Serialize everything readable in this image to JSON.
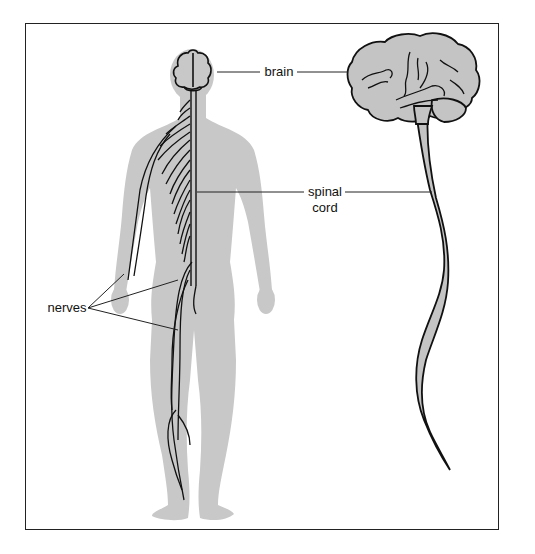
{
  "diagram": {
    "title": "",
    "labels": {
      "brain": "brain",
      "spinal_cord_line1": "spinal",
      "spinal_cord_line2": "cord",
      "nerves": "nerves"
    },
    "colors": {
      "body_fill": "#c8c8c8",
      "organ_fill": "#c4c4c4",
      "line": "#111111",
      "frame": "#222222",
      "background": "#ffffff"
    },
    "figures": [
      {
        "id": "human-body-back-view",
        "description": "Human silhouette viewed from behind with brain, spinal cord and nerves drawn on left side"
      },
      {
        "id": "brain-and-spinal-cord-side-view",
        "description": "Side view of brain with spinal cord trailing down"
      }
    ]
  }
}
